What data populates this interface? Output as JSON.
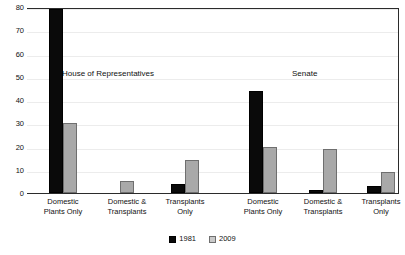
{
  "chart_data": {
    "type": "bar",
    "title": "",
    "xlabel": "",
    "ylabel": "",
    "ylim": [
      0,
      80
    ],
    "ytick_step": 10,
    "yticks": [
      "0",
      "10",
      "20",
      "30",
      "40",
      "50",
      "60",
      "70",
      "80"
    ],
    "grid": true,
    "legend_position": "bottom-center",
    "categories": [
      "Domestic\nPlants Only",
      "Domestic &\nTransplants",
      "Transplants\nOnly"
    ],
    "panels": [
      {
        "name": "House of Representatives",
        "series": [
          {
            "name": "1981",
            "color": "#0a0a0a",
            "values": [
              79,
              0,
              4
            ]
          },
          {
            "name": "2009",
            "color": "#a9a9a9",
            "values": [
              30,
              5,
              14
            ]
          }
        ]
      },
      {
        "name": "Senate",
        "series": [
          {
            "name": "1981",
            "color": "#0a0a0a",
            "values": [
              44,
              1.5,
              3
            ]
          },
          {
            "name": "2009",
            "color": "#a9a9a9",
            "values": [
              20,
              19,
              9
            ]
          }
        ]
      }
    ],
    "series": [
      {
        "name": "1981",
        "color": "#0a0a0a"
      },
      {
        "name": "2009",
        "color": "#a9a9a9"
      }
    ]
  },
  "legend": {
    "entries": [
      {
        "label": "1981"
      },
      {
        "label": "2009"
      }
    ]
  },
  "colors": {
    "series_1981": "#0a0a0a",
    "series_2009": "#a9a9a9",
    "axis": "#2b2b2b",
    "gridline": "#ececec",
    "background": "#ffffff"
  }
}
